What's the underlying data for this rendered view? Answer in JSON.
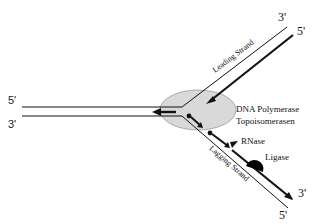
{
  "diagram": {
    "left_duplex": {
      "top_end": "5'",
      "bottom_end": "3'"
    },
    "leading_strand": {
      "label": "Leading Strand",
      "top_end": "3'",
      "bottom_end": "5'"
    },
    "lagging_strand": {
      "label": "Lagging Strand",
      "top_end": "3'",
      "bottom_end": "5'"
    },
    "enzymes": {
      "polymerase": "DNA Polymerase",
      "topoisomerase": "Topoisomerasen",
      "rnase": "RNase",
      "ligase": "Ligase"
    },
    "colors": {
      "line": "#111111",
      "complex_fill": "#d9d9d9",
      "complex_stroke": "#9a9a9a",
      "ligase": "#000000"
    }
  }
}
